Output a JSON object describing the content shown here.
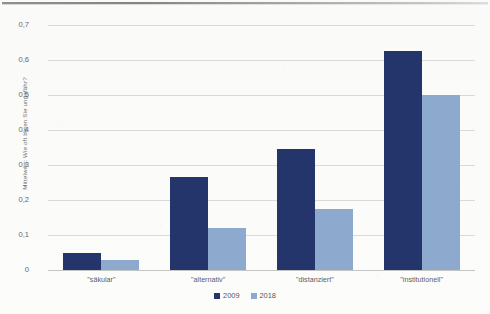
{
  "chart_data": {
    "type": "bar",
    "title": "",
    "xlabel": "",
    "ylabel": "Mittelwert: Wie oft beten Sie ungefähr?",
    "categories": [
      "\"säkular\"",
      "\"alternativ\"",
      "\"distanziert\"",
      "\"institutionell\""
    ],
    "series": [
      {
        "name": "2009",
        "color": "#23356b",
        "values": [
          0.05,
          0.265,
          0.345,
          0.625
        ]
      },
      {
        "name": "2018",
        "color": "#8ea9ce",
        "values": [
          0.03,
          0.12,
          0.175,
          0.5
        ]
      }
    ],
    "ylim": [
      0,
      0.7
    ],
    "yticks": [
      0,
      0.1,
      0.2,
      0.3,
      0.4,
      0.5,
      0.6,
      0.7
    ],
    "ytick_labels": [
      "0",
      "0,1",
      "0,2",
      "0,3",
      "0,4",
      "0,5",
      "0,6",
      "0,7"
    ],
    "grid": true,
    "legend_position": "bottom",
    "decimal_separator": ","
  },
  "legend": {
    "items": [
      {
        "label": "2009"
      },
      {
        "label": "2018"
      }
    ]
  }
}
